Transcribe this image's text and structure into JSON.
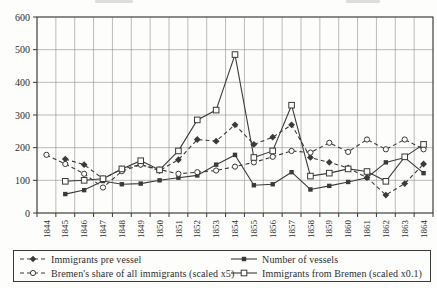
{
  "styles": {
    "ink": "#3a3a3a",
    "grid": "#8f8f8f",
    "paper": "#fdfdfc",
    "text": "#2e2e2e"
  },
  "chart_data": {
    "type": "line",
    "title": "",
    "xlabel": "",
    "ylabel": "",
    "ylim": [
      0,
      600
    ],
    "yticks": [
      0,
      100,
      200,
      300,
      400,
      500,
      600
    ],
    "grid": "on",
    "legend_position": "bottom-box",
    "categories": [
      "1844",
      "1845",
      "1846",
      "1847",
      "1848",
      "1849",
      "1850",
      "1851",
      "1852",
      "1853",
      "1854",
      "1855",
      "1856",
      "1857",
      "1858",
      "1859",
      "1860",
      "1861",
      "1862",
      "1863",
      "1864"
    ],
    "series": [
      {
        "name": "Immigrants pre vessel",
        "line": "dashed",
        "marker": "diamond-filled",
        "values": [
          null,
          165,
          148,
          105,
          135,
          148,
          130,
          163,
          225,
          220,
          270,
          210,
          232,
          270,
          170,
          155,
          138,
          108,
          55,
          90,
          150
        ]
      },
      {
        "name": "Number of vessels",
        "line": "solid",
        "marker": "square-filled",
        "values": [
          null,
          58,
          70,
          98,
          88,
          90,
          100,
          108,
          115,
          148,
          178,
          85,
          88,
          125,
          72,
          83,
          95,
          108,
          155,
          170,
          122
        ]
      },
      {
        "name": "Bremen's share of all immigrants (scaled x5)",
        "line": "dashed",
        "marker": "circle-open",
        "values": [
          178,
          150,
          120,
          78,
          128,
          148,
          133,
          120,
          125,
          130,
          142,
          155,
          172,
          190,
          185,
          215,
          187,
          225,
          195,
          225,
          195
        ]
      },
      {
        "name": "Immigrants from Bremen (scaled x0.1)",
        "line": "solid",
        "marker": "square-open",
        "values": [
          null,
          97,
          100,
          105,
          135,
          160,
          132,
          190,
          285,
          315,
          485,
          170,
          190,
          330,
          113,
          122,
          135,
          127,
          97,
          172,
          210
        ]
      }
    ]
  },
  "legend": {
    "order": [
      0,
      1,
      2,
      3
    ]
  }
}
